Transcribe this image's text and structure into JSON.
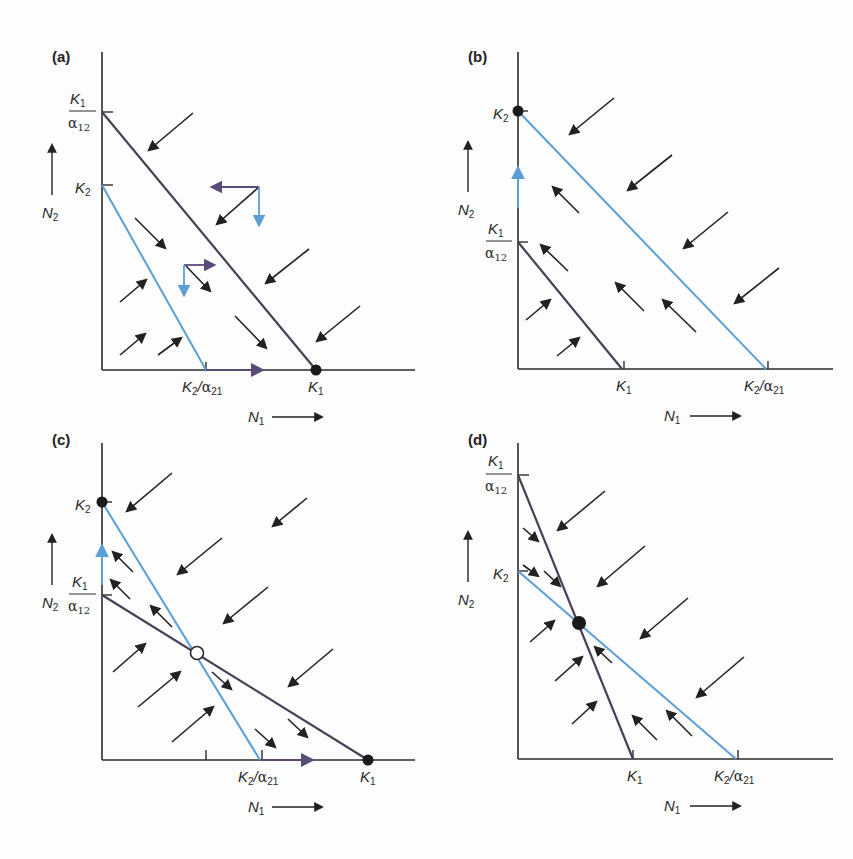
{
  "figure": {
    "colors": {
      "axis": "#2b2b2b",
      "species1_isocline": "#4a3f55",
      "species2_isocline": "#5b9fd6",
      "arrow": "#222222",
      "purple_arrow": "#5a4a78",
      "blue_arrow": "#5b9fd6"
    },
    "panels": [
      {
        "id": "a",
        "label": "(a)",
        "outcome": "species 1 wins",
        "y_ticks": [
          "K1/α12",
          "K2"
        ],
        "x_ticks": [
          "K2/α21",
          "K1"
        ],
        "x_axis": "N1",
        "y_axis": "N2"
      },
      {
        "id": "b",
        "label": "(b)",
        "outcome": "species 2 wins",
        "y_ticks": [
          "K2",
          "K1/α12"
        ],
        "x_ticks": [
          "K1",
          "K2/α21"
        ],
        "x_axis": "N1",
        "y_axis": "N2"
      },
      {
        "id": "c",
        "label": "(c)",
        "outcome": "unstable equilibrium",
        "y_ticks": [
          "K2",
          "K1/α12"
        ],
        "x_ticks": [
          "K2/α21",
          "K1"
        ],
        "x_axis": "N1",
        "y_axis": "N2"
      },
      {
        "id": "d",
        "label": "(d)",
        "outcome": "stable coexistence",
        "y_ticks": [
          "K1/α12",
          "K2"
        ],
        "x_ticks": [
          "K1",
          "K2/α21"
        ],
        "x_axis": "N1",
        "y_axis": "N2"
      }
    ],
    "text": {
      "K": "K",
      "sub1": "1",
      "sub2": "2",
      "alpha": "α",
      "sub12": "12",
      "sub21": "21",
      "slash": "/",
      "N": "N"
    }
  }
}
